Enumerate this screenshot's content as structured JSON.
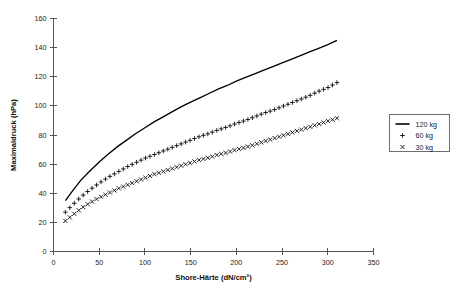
{
  "chart_data": {
    "type": "line",
    "title": "",
    "xlabel": "Shore-Härte (dN/cm²)",
    "ylabel": "Maximaldruck (hPa)",
    "xlim": [
      0,
      350
    ],
    "ylim": [
      0,
      160
    ],
    "xticks": [
      0,
      50,
      100,
      150,
      200,
      250,
      300,
      350
    ],
    "yticks": [
      0,
      20,
      40,
      60,
      80,
      100,
      120,
      140,
      160
    ],
    "grid": false,
    "legend_position": "right",
    "series": [
      {
        "name": "120 kg",
        "marker": "line",
        "style": "solid-line",
        "x": [
          13,
          20,
          30,
          40,
          50,
          60,
          70,
          80,
          90,
          100,
          110,
          120,
          130,
          140,
          150,
          160,
          170,
          180,
          190,
          200,
          210,
          220,
          230,
          240,
          250,
          260,
          270,
          280,
          290,
          300,
          310
        ],
        "y": [
          35,
          41,
          49,
          55.5,
          61.5,
          67,
          72,
          76.5,
          81,
          85,
          89,
          92.5,
          96,
          99.5,
          102.5,
          105.5,
          108.5,
          111.5,
          114,
          117,
          119.5,
          122,
          124.5,
          127,
          129.5,
          132,
          134.5,
          137,
          139.5,
          142,
          145
        ]
      },
      {
        "name": "60 kg",
        "marker": "plus",
        "style": "points",
        "x": [
          13,
          20,
          30,
          40,
          50,
          60,
          70,
          80,
          90,
          100,
          110,
          120,
          130,
          140,
          150,
          160,
          170,
          180,
          190,
          200,
          210,
          220,
          230,
          240,
          250,
          260,
          270,
          280,
          290,
          300,
          310
        ],
        "y": [
          27,
          31.5,
          37.5,
          42.5,
          47,
          51,
          54.5,
          58,
          61,
          64,
          66.5,
          69,
          71.5,
          74,
          76.5,
          79,
          81,
          83.5,
          85.5,
          88,
          90,
          92.5,
          95,
          97,
          99.5,
          102,
          104.5,
          107,
          110,
          112.5,
          116
        ]
      },
      {
        "name": "30 kg",
        "marker": "cross",
        "style": "points",
        "x": [
          13,
          20,
          30,
          40,
          50,
          60,
          70,
          80,
          90,
          100,
          110,
          120,
          130,
          140,
          150,
          160,
          170,
          180,
          190,
          200,
          210,
          220,
          230,
          240,
          250,
          260,
          270,
          280,
          290,
          300,
          310
        ],
        "y": [
          21,
          24.5,
          29.5,
          33.5,
          37,
          40,
          43,
          45.5,
          48,
          50.5,
          53,
          55,
          57,
          59,
          61,
          63,
          64.5,
          66.5,
          68,
          70,
          71.5,
          73.5,
          75.5,
          77.5,
          79.5,
          81.5,
          83.5,
          85.5,
          87.5,
          89.5,
          91.5
        ]
      }
    ]
  },
  "legend": {
    "items": [
      {
        "label": "120 kg",
        "glyph": "line-swatch"
      },
      {
        "label": "60 kg",
        "glyph": "plus-swatch"
      },
      {
        "label": "30 kg",
        "glyph": "cross-swatch"
      }
    ]
  },
  "colors": {
    "series": "#000000",
    "axis": "#555555",
    "text": "#1a1a1a",
    "background": "#ffffff"
  }
}
